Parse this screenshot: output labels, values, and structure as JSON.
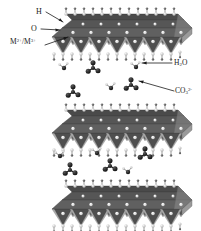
{
  "figure": {
    "background_color": "#ffffff",
    "width": 201,
    "height": 231
  },
  "labels": {
    "hydrogen": "H",
    "oxygen": "O",
    "metal_cations_main": "M",
    "metal_cations_sup1": "2+",
    "metal_cations_sep": "/M",
    "metal_cations_sup2": "3+",
    "water_main": "H",
    "water_sub": "2",
    "water_tail": "O",
    "carbonate_main": "CO",
    "carbonate_sub": "3",
    "carbonate_sup": "2-"
  },
  "structure": {
    "slab_count": 3,
    "interlayer_count": 2,
    "slabs": [
      {
        "name": "hydroxide-slab-top",
        "y": 14,
        "octahedra": 7
      },
      {
        "name": "hydroxide-slab-middle",
        "y": 110,
        "octahedra": 7
      },
      {
        "name": "hydroxide-slab-bottom",
        "y": 186,
        "octahedra": 7
      }
    ],
    "colors": {
      "octahedron_top_face": "#4d4d4d",
      "octahedron_front_face": "#6e6e6e",
      "octahedron_side_face": "#a8a8a8",
      "slab_edge": "#3a3a3a",
      "oxygen_sphere": "#e8e8e8",
      "hydrogen_sphere": "#d0d0d0",
      "metal_sphere": "#f0f0f0",
      "carbon_sphere": "#1e1e1e",
      "carbonate_oxygen": "#141414",
      "water_oxygen": "#2a2a2a",
      "water_hydrogen": "#bdbdbd",
      "leader_line": "#1a1a1a"
    },
    "interlayer_species": [
      {
        "type": "carbonate",
        "x": 95,
        "y": 66
      },
      {
        "type": "water",
        "x": 64,
        "y": 64
      },
      {
        "type": "water",
        "x": 134,
        "y": 63
      },
      {
        "type": "carbonate",
        "x": 73,
        "y": 88
      },
      {
        "type": "water",
        "x": 110,
        "y": 83
      },
      {
        "type": "carbonate",
        "x": 131,
        "y": 82
      },
      {
        "type": "water",
        "x": 60,
        "y": 152
      },
      {
        "type": "water",
        "x": 95,
        "y": 150
      },
      {
        "type": "carbonate",
        "x": 70,
        "y": 166
      },
      {
        "type": "carbonate",
        "x": 110,
        "y": 162
      },
      {
        "type": "carbonate",
        "x": 145,
        "y": 150
      },
      {
        "type": "water",
        "x": 128,
        "y": 168
      }
    ]
  },
  "annotations": [
    {
      "name": "leader-h",
      "from": [
        46,
        12
      ],
      "to": [
        62,
        22
      ]
    },
    {
      "name": "leader-o",
      "from": [
        42,
        29
      ],
      "to": [
        58,
        31
      ]
    },
    {
      "name": "leader-m",
      "from": [
        45,
        45
      ],
      "to": [
        66,
        38
      ]
    },
    {
      "name": "leader-h2o",
      "from": [
        172,
        63
      ],
      "to": [
        143,
        63
      ]
    },
    {
      "name": "leader-co3",
      "from": [
        174,
        91
      ],
      "to": [
        139,
        81
      ]
    }
  ]
}
